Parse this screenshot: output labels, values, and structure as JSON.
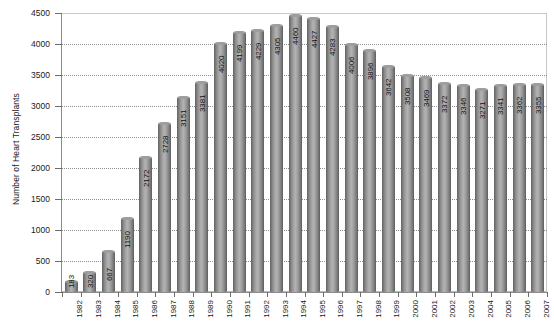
{
  "chart_data": {
    "type": "bar",
    "title": "",
    "xlabel": "",
    "ylabel": "Number of Heart Transplants",
    "ylim": [
      0,
      4500
    ],
    "yticks": [
      0,
      500,
      1000,
      1500,
      2000,
      2500,
      3000,
      3500,
      4000,
      4500
    ],
    "ytick_labels": [
      "0",
      "500",
      "1000",
      "1500",
      "2000",
      "2500",
      "3000",
      "3500",
      "4000",
      "4500"
    ],
    "grid": true,
    "legend": "none",
    "bar_style": "3d-cylinder",
    "value_labels": true,
    "value_label_orientation": "vertical",
    "categories": [
      "1982",
      "1983",
      "1984",
      "1985",
      "1986",
      "1987",
      "1988",
      "1989",
      "1990",
      "1991",
      "1992",
      "1993",
      "1994",
      "1995",
      "1996",
      "1997",
      "1998",
      "1999",
      "2000",
      "2001",
      "2002",
      "2003",
      "2004",
      "2005",
      "2006",
      "2007"
    ],
    "values": [
      183,
      320,
      667,
      1190,
      2172,
      2728,
      3151,
      3381,
      4020,
      4199,
      4229,
      4305,
      4460,
      4427,
      4283,
      4006,
      3896,
      3642,
      3508,
      3469,
      3372,
      3346,
      3271,
      3341,
      3362,
      3355
    ]
  },
  "colors": {
    "bar_dark": "#636363",
    "bar_light": "#b2b2b2",
    "grid": "#8e8e8e",
    "frame": "#b9b9b9",
    "text": "#1a1a1a",
    "background": "#ffffff"
  }
}
